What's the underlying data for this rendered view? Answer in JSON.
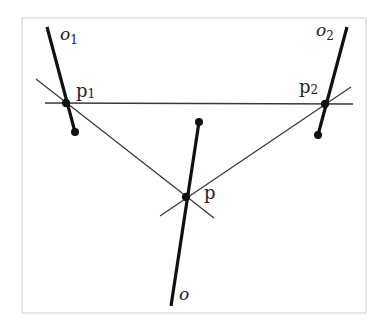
{
  "diagram": {
    "frame": {
      "x": 22,
      "y": 18,
      "width": 344,
      "height": 295,
      "color": "#d8d8d8"
    },
    "colors": {
      "thin_line": "#3a3a3a",
      "thick_line": "#111111",
      "point": "#111111",
      "label": "#222222"
    },
    "labels": {
      "o1": {
        "main": "o",
        "sub": "1"
      },
      "o2": {
        "main": "o",
        "sub": "2"
      },
      "o": {
        "main": "o"
      },
      "p1": {
        "main": "p",
        "sub": "1"
      },
      "p2": {
        "main": "p",
        "sub": "2"
      },
      "p": {
        "main": "p"
      }
    },
    "points": {
      "p1": {
        "x": 66,
        "y": 103
      },
      "p2": {
        "x": 325,
        "y": 104
      },
      "p": {
        "x": 186,
        "y": 197
      },
      "o1_end": {
        "x": 75,
        "y": 132
      },
      "o2_end": {
        "x": 318,
        "y": 135
      },
      "o_end": {
        "x": 199,
        "y": 122
      }
    },
    "thick_lines": [
      {
        "name": "ray-o1",
        "from": [
          47,
          27
        ],
        "to": [
          75,
          132
        ]
      },
      {
        "name": "ray-o2",
        "from": [
          347,
          27
        ],
        "to": [
          318,
          135
        ]
      },
      {
        "name": "ray-o",
        "from": [
          199,
          122
        ],
        "to": [
          171,
          306
        ]
      }
    ],
    "thin_lines": [
      {
        "name": "line-p1-p2",
        "from": [
          45,
          103
        ],
        "to": [
          353,
          104
        ]
      },
      {
        "name": "line-p1-p",
        "from": [
          36,
          79
        ],
        "to": [
          214,
          218
        ]
      },
      {
        "name": "line-p2-p",
        "from": [
          351,
          87
        ],
        "to": [
          160,
          216
        ]
      }
    ]
  }
}
